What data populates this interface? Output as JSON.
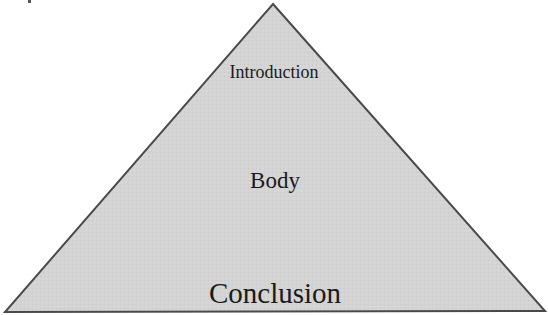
{
  "diagram": {
    "type": "pyramid",
    "colors": {
      "fill": "#d3d3d3",
      "stroke": "#4a4a4a",
      "text": "#1a1a1a",
      "background": "#ffffff"
    },
    "levels": [
      {
        "position": "top",
        "label": "Introduction"
      },
      {
        "position": "middle",
        "label": "Body"
      },
      {
        "position": "bottom",
        "label": "Conclusion"
      }
    ]
  }
}
